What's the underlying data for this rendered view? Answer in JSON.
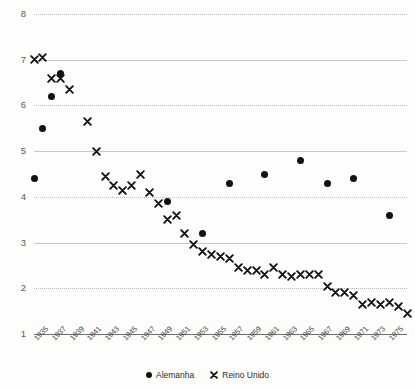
{
  "chart_data": {
    "type": "scatter",
    "title": "",
    "xlabel": "",
    "ylabel": "",
    "xlim": [
      1935,
      1975
    ],
    "ylim": [
      1,
      8
    ],
    "grid": true,
    "legend_position": "bottom",
    "y_ticks": [
      1,
      2,
      3,
      4,
      5,
      6,
      7,
      8
    ],
    "x_tick_labels": [
      "1935",
      "1937",
      "1939",
      "1941",
      "1943",
      "1945",
      "1947",
      "1949",
      "1951",
      "1953",
      "1955",
      "1957",
      "1959",
      "1961",
      "1963",
      "1965",
      "1967",
      "1969",
      "1971",
      "1973",
      "1975"
    ],
    "series": [
      {
        "name": "Alemanha",
        "marker": "circle",
        "color": "#111111",
        "points": [
          {
            "x": 1935,
            "y": 4.4
          },
          {
            "x": 1936,
            "y": 5.5
          },
          {
            "x": 1937,
            "y": 6.2
          },
          {
            "x": 1938,
            "y": 6.7
          },
          {
            "x": 1950,
            "y": 3.9
          },
          {
            "x": 1954,
            "y": 3.2
          },
          {
            "x": 1957,
            "y": 4.3
          },
          {
            "x": 1961,
            "y": 4.5
          },
          {
            "x": 1965,
            "y": 4.8
          },
          {
            "x": 1968,
            "y": 4.3
          },
          {
            "x": 1971,
            "y": 4.4
          },
          {
            "x": 1975,
            "y": 3.6
          }
        ]
      },
      {
        "name": "Reino Unido",
        "marker": "x",
        "color": "#111111",
        "points": [
          {
            "x": 1935,
            "y": 7.0
          },
          {
            "x": 1936,
            "y": 7.05
          },
          {
            "x": 1937,
            "y": 6.6
          },
          {
            "x": 1938,
            "y": 6.6
          },
          {
            "x": 1939,
            "y": 6.35
          },
          {
            "x": 1941,
            "y": 5.65
          },
          {
            "x": 1942,
            "y": 5.0
          },
          {
            "x": 1943,
            "y": 4.45
          },
          {
            "x": 1944,
            "y": 4.25
          },
          {
            "x": 1945,
            "y": 4.15
          },
          {
            "x": 1946,
            "y": 4.25
          },
          {
            "x": 1947,
            "y": 4.5
          },
          {
            "x": 1948,
            "y": 4.1
          },
          {
            "x": 1949,
            "y": 3.85
          },
          {
            "x": 1950,
            "y": 3.5
          },
          {
            "x": 1951,
            "y": 3.6
          },
          {
            "x": 1952,
            "y": 3.2
          },
          {
            "x": 1953,
            "y": 2.95
          },
          {
            "x": 1954,
            "y": 2.8
          },
          {
            "x": 1955,
            "y": 2.75
          },
          {
            "x": 1956,
            "y": 2.7
          },
          {
            "x": 1957,
            "y": 2.65
          },
          {
            "x": 1958,
            "y": 2.45
          },
          {
            "x": 1959,
            "y": 2.4
          },
          {
            "x": 1960,
            "y": 2.4
          },
          {
            "x": 1961,
            "y": 2.3
          },
          {
            "x": 1962,
            "y": 2.45
          },
          {
            "x": 1963,
            "y": 2.3
          },
          {
            "x": 1964,
            "y": 2.25
          },
          {
            "x": 1965,
            "y": 2.3
          },
          {
            "x": 1966,
            "y": 2.3
          },
          {
            "x": 1967,
            "y": 2.3
          },
          {
            "x": 1968,
            "y": 2.05
          },
          {
            "x": 1969,
            "y": 1.9
          },
          {
            "x": 1970,
            "y": 1.9
          },
          {
            "x": 1971,
            "y": 1.85
          },
          {
            "x": 1972,
            "y": 1.65
          },
          {
            "x": 1973,
            "y": 1.7
          },
          {
            "x": 1974,
            "y": 1.65
          },
          {
            "x": 1975,
            "y": 1.7
          },
          {
            "x": 1976,
            "y": 1.6
          },
          {
            "x": 1977,
            "y": 1.45
          }
        ]
      }
    ]
  },
  "legend": {
    "items": [
      {
        "label": "Alemanha",
        "marker": "circle"
      },
      {
        "label": "Reino Unido",
        "marker": "x"
      }
    ]
  }
}
